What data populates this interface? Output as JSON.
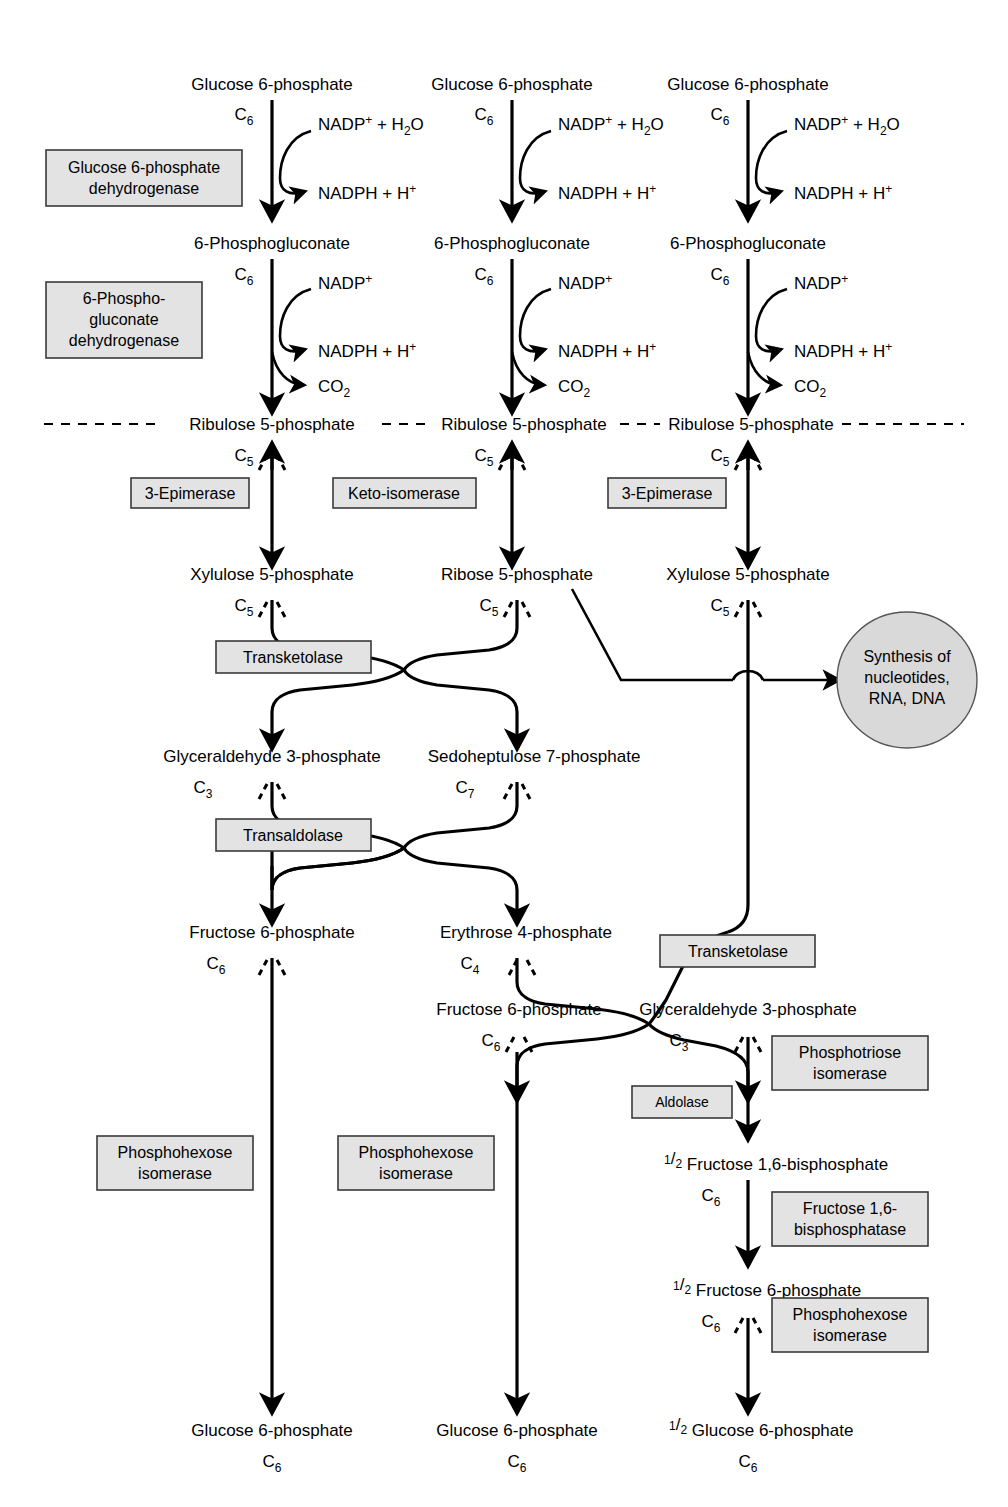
{
  "figure": {
    "colors": {
      "box_fill": "#e3e3e3",
      "box_stroke": "#3a3a3a",
      "ellipse_fill": "#d9d9d9",
      "line": "#000000"
    }
  },
  "metabolites": {
    "glucose6p": "Glucose 6-phosphate",
    "phosphogluconate": "6-Phosphogluconate",
    "ribulose5p": "Ribulose 5-phosphate",
    "xylulose5p": "Xylulose 5-phosphate",
    "ribose5p": "Ribose 5-phosphate",
    "gap": "Glyceraldehyde 3-phosphate",
    "sedoheptulose7p": "Sedoheptulose 7-phosphate",
    "fructose6p": "Fructose 6-phosphate",
    "erythrose4p": "Erythrose 4-phosphate",
    "fbp": "Fructose 1,6-bisphosphate"
  },
  "carbon_labels": {
    "c3": "C3",
    "c4": "C4",
    "c5": "C5",
    "c6": "C6",
    "c7": "C7"
  },
  "cofactors": {
    "nadp_h2o": "NADP+ + H2O",
    "nadp": "NADP+",
    "nadph_h": "NADPH + H+",
    "co2": "CO2"
  },
  "enzymes": {
    "g6pd": "Glucose 6-phosphate dehydrogenase",
    "pgd_l1": "6-Phospho-",
    "pgd_l2": "gluconate",
    "pgd_l3": "dehydrogenase",
    "epimerase": "3-Epimerase",
    "keto_isomerase": "Keto-isomerase",
    "transketolase": "Transketolase",
    "transaldolase": "Transaldolase",
    "phosphohexose_l1": "Phosphohexose",
    "phosphohexose_l2": "isomerase",
    "aldolase": "Aldolase",
    "phosphotriose_l1": "Phosphotriose",
    "phosphotriose_l2": "isomerase",
    "fbpase_l1": "Fructose 1,6-",
    "fbpase_l2": "bisphosphatase"
  },
  "sink": {
    "line1": "Synthesis of",
    "line2": "nucleotides,",
    "line3": "RNA, DNA"
  },
  "fraction": {
    "numerator": "1",
    "slash": "/",
    "denominator": "2"
  },
  "columns": [
    {
      "id": "column-1",
      "x": 272,
      "top_metabolite": "Glucose 6-phosphate",
      "steps": [
        "Glucose 6-phosphate dehydrogenase",
        "6-Phosphogluconate dehydrogenase",
        "3-Epimerase",
        "Transketolase",
        "Transaldolase",
        "Phosphohexose isomerase"
      ],
      "bottom_metabolite": "Glucose 6-phosphate"
    },
    {
      "id": "column-2",
      "x": 512,
      "top_metabolite": "Glucose 6-phosphate",
      "steps": [
        "Glucose 6-phosphate dehydrogenase",
        "6-Phosphogluconate dehydrogenase",
        "Keto-isomerase",
        "Transketolase",
        "Phosphohexose isomerase"
      ],
      "bottom_metabolite": "Glucose 6-phosphate"
    },
    {
      "id": "column-3",
      "x": 748,
      "top_metabolite": "Glucose 6-phosphate",
      "steps": [
        "Glucose 6-phosphate dehydrogenase",
        "6-Phosphogluconate dehydrogenase",
        "3-Epimerase",
        "Transketolase",
        "Phosphotriose isomerase",
        "Aldolase",
        "Fructose 1,6-bisphosphatase",
        "Phosphohexose isomerase"
      ],
      "bottom_metabolite": "Glucose 6-phosphate"
    }
  ]
}
